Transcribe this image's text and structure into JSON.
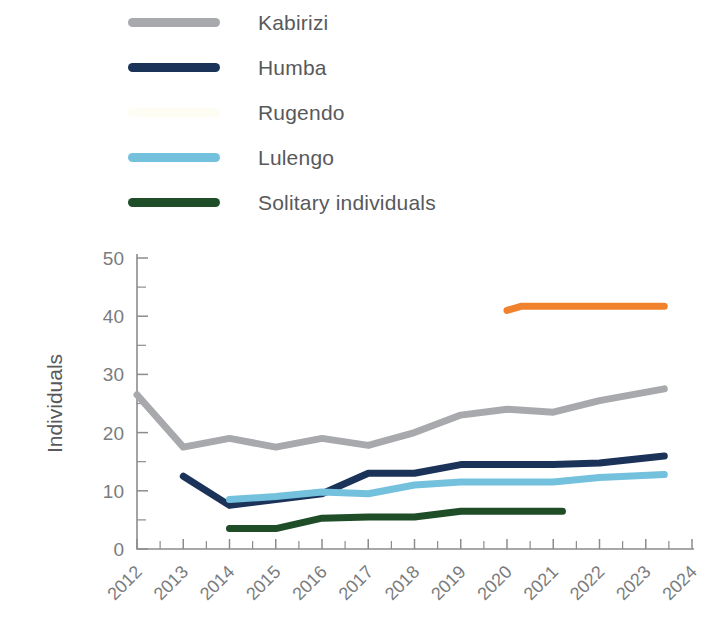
{
  "legend": {
    "position": "above-plot",
    "items": [
      {
        "label": "Kabirizi",
        "color": "#a7a9ac",
        "swatch": "legend-swatch-kabirizi"
      },
      {
        "label": "Humba",
        "color": "#1b3359",
        "swatch": "legend-swatch-humba"
      },
      {
        "label": "Rugendo",
        "color": "#fdfdf4",
        "swatch": "legend-swatch-rugendo"
      },
      {
        "label": "Lulengo",
        "color": "#74c1de",
        "swatch": "legend-swatch-lulengo"
      },
      {
        "label": "Solitary individuals",
        "color": "#1f4d28",
        "swatch": "legend-swatch-solitary"
      }
    ]
  },
  "chart_data": {
    "type": "line",
    "title": "",
    "subtitle": "",
    "xlabel": "",
    "ylabel": "Individuals",
    "xlim": [
      2012,
      2024
    ],
    "ylim": [
      0,
      50
    ],
    "grid": false,
    "legend_position": "top",
    "x": [
      2012,
      2013,
      2014,
      2015,
      2016,
      2017,
      2018,
      2019,
      2020,
      2021,
      2022,
      2023,
      2024
    ],
    "xtick_labels": [
      "2012",
      "2013",
      "2014",
      "2015",
      "2016",
      "2017",
      "2018",
      "2019",
      "2020",
      "2021",
      "2022",
      "2023",
      "2024"
    ],
    "ytick_labels": [
      "0",
      "10",
      "20",
      "30",
      "40",
      "50"
    ],
    "ytick_values": [
      0,
      10,
      20,
      30,
      40,
      50
    ],
    "ytick_minor_values": [
      5,
      15,
      25,
      35,
      45
    ],
    "xtick_minor_step": 0.5,
    "series": [
      {
        "name": "Kabirizi",
        "color": "#a7a9ac",
        "x": [
          2012,
          2013,
          2014,
          2015,
          2016,
          2017,
          2018,
          2019,
          2020,
          2021,
          2022,
          2023.4
        ],
        "values": [
          26.5,
          17.5,
          19.0,
          17.5,
          19.0,
          17.8,
          20.0,
          23.0,
          24.0,
          23.5,
          25.5,
          27.5
        ]
      },
      {
        "name": "Humba",
        "color": "#1b3359",
        "x": [
          2013,
          2014,
          2015,
          2016,
          2017,
          2018,
          2019,
          2020,
          2021,
          2022,
          2023.4
        ],
        "values": [
          12.5,
          7.5,
          8.5,
          9.5,
          13.0,
          13.0,
          14.5,
          14.5,
          14.5,
          14.8,
          16.0
        ]
      },
      {
        "name": "Rugendo",
        "color": "#f0822e",
        "x": [
          2020,
          2020.3,
          2023.4
        ],
        "values": [
          41.0,
          41.7,
          41.7
        ]
      },
      {
        "name": "Lulengo",
        "color": "#74c1de",
        "x": [
          2014,
          2015,
          2016,
          2017,
          2018,
          2019,
          2020,
          2021,
          2022,
          2023.4
        ],
        "values": [
          8.5,
          9.0,
          9.8,
          9.5,
          11.0,
          11.5,
          11.5,
          11.5,
          12.3,
          12.8
        ]
      },
      {
        "name": "Solitary individuals",
        "color": "#1f4d28",
        "x": [
          2014,
          2015,
          2016,
          2017,
          2018,
          2019,
          2020,
          2021.2
        ],
        "values": [
          3.5,
          3.5,
          5.3,
          5.5,
          5.5,
          6.5,
          6.5,
          6.5
        ]
      }
    ]
  }
}
